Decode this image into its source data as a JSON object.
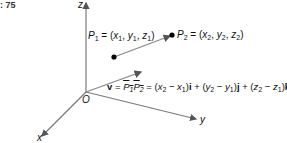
{
  "figure": {
    "number_label": ": 75"
  },
  "axes": {
    "z_label": "z",
    "y_label": "y",
    "x_label": "x",
    "origin_label": "O"
  },
  "points": {
    "p1": {
      "name": "P",
      "sub": "1",
      "eq": " = (",
      "coords": [
        "x",
        "y",
        "z"
      ],
      "coord_sub": "1"
    },
    "p2": {
      "name": "P",
      "sub": "2",
      "eq": " = (",
      "coords": [
        "x",
        "y",
        "z"
      ],
      "coord_sub": "2"
    }
  },
  "vector_equation": {
    "v": "v",
    "equals": " = ",
    "text": "v = P1P2 = (x2 − x1)i + (y2 − y1)j + (z2 − z1)k"
  },
  "colors": {
    "axis": "#7a7a7a",
    "vector": "#888888",
    "point": "#000000",
    "text": "#111111"
  }
}
